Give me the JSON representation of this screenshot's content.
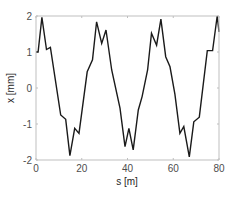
{
  "chart_data": {
    "type": "line",
    "title": "",
    "xlabel": "s [m]",
    "ylabel": "x [mm]",
    "xlim": [
      0,
      80
    ],
    "ylim": [
      -2,
      2
    ],
    "xticks": [
      0,
      20,
      40,
      60,
      80
    ],
    "yticks": [
      -2,
      -1,
      0,
      1,
      2
    ],
    "grid": false,
    "legend": null,
    "series": [
      {
        "name": "x(s)",
        "color": "#1a1a1a",
        "x": [
          0,
          0.9,
          2.6,
          4.6,
          6.3,
          10.8,
          13.0,
          14.8,
          16.9,
          18.8,
          22.4,
          24.7,
          26.5,
          28.7,
          30.6,
          33.1,
          36.7,
          38.9,
          40.6,
          42.5,
          44.7,
          46.4,
          48.8,
          50.5,
          52.7,
          54.6,
          56.7,
          58.6,
          60.7,
          62.9,
          64.6,
          67.0,
          69.0,
          71.4,
          74.9,
          77.2,
          79.2,
          80.0
        ],
        "y": [
          1.0,
          1.0,
          1.96,
          1.07,
          1.13,
          -0.75,
          -0.87,
          -1.88,
          -1.12,
          -1.26,
          0.45,
          0.78,
          1.84,
          1.24,
          1.61,
          0.5,
          -0.56,
          -1.63,
          -1.12,
          -1.72,
          -0.61,
          -0.24,
          0.5,
          1.52,
          1.19,
          1.91,
          0.87,
          0.59,
          -0.17,
          -1.26,
          -1.07,
          -1.91,
          -0.94,
          -0.81,
          1.04,
          1.04,
          2.0,
          1.56
        ]
      }
    ]
  },
  "axes": {
    "x_tick_labels": [
      "0",
      "20",
      "40",
      "60",
      "80"
    ],
    "y_tick_labels": [
      "-2",
      "-1",
      "0",
      "1",
      "2"
    ],
    "xlabel": "s [m]",
    "ylabel": "x [mm]"
  },
  "colors": {
    "line": "#1a1a1a",
    "axis": "#262626",
    "box": "#bfbfbf",
    "background": "#ffffff"
  }
}
